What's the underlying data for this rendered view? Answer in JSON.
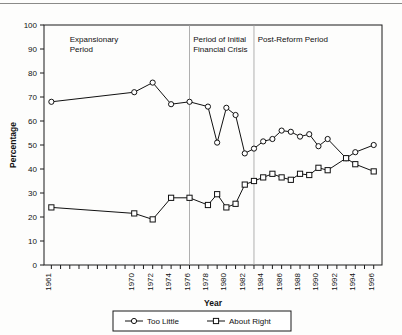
{
  "chart_data": {
    "type": "line",
    "title": "",
    "xlabel": "Year",
    "ylabel": "Percentage",
    "ylim": [
      0,
      100
    ],
    "ytick_step": 10,
    "yticks": [
      0,
      10,
      20,
      30,
      40,
      50,
      60,
      70,
      80,
      90,
      100
    ],
    "grid": false,
    "legend_position": "bottom",
    "x": [
      1961,
      1970,
      1972,
      1974,
      1976,
      1978,
      1979,
      1980,
      1981,
      1982,
      1983,
      1984,
      1985,
      1986,
      1987,
      1988,
      1989,
      1990,
      1991,
      1993,
      1994,
      1996
    ],
    "xticks": [
      1961,
      1970,
      1972,
      1974,
      1976,
      1978,
      1980,
      1982,
      1984,
      1986,
      1988,
      1990,
      1992,
      1994,
      1996
    ],
    "xtick_labels": [
      "1961",
      "1970",
      "1972",
      "1974",
      "1976",
      "1978",
      "1980",
      "1982",
      "1984",
      "1986",
      "1988",
      "1990",
      "1992",
      "1994",
      "1996"
    ],
    "series": [
      {
        "name": "Too Little",
        "marker": "circle",
        "values": [
          68,
          72,
          76,
          67,
          68,
          66,
          51,
          65.5,
          62.5,
          46.5,
          48.5,
          51.5,
          52.5,
          56,
          55.5,
          53.5,
          54.5,
          49.5,
          52.5,
          44.5,
          47,
          50
        ]
      },
      {
        "name": "About Right",
        "marker": "square",
        "values": [
          24,
          21.5,
          19,
          28,
          28,
          25,
          29.5,
          24,
          25.5,
          33.5,
          35,
          36.5,
          38,
          36.5,
          35.5,
          38,
          37.5,
          40.5,
          39.5,
          44.5,
          42,
          39
        ]
      }
    ],
    "annotations": [
      {
        "text_lines": [
          "Expansionary",
          "Period"
        ],
        "x_year": 1963,
        "y_value": 93
      },
      {
        "text_lines": [
          "Period of Initial",
          "Financial Crisis"
        ],
        "x_year": 1976.4,
        "y_value": 93
      },
      {
        "text_lines": [
          "Post-Reform Period"
        ],
        "x_year": 1983.4,
        "y_value": 93
      }
    ],
    "dividers": [
      1976,
      1983
    ]
  },
  "legend": {
    "entries": [
      {
        "label": "Too Little",
        "marker": "circle"
      },
      {
        "label": "About Right",
        "marker": "square"
      }
    ]
  },
  "colors": {
    "ink": "#111111",
    "divider": "#9a9a9a",
    "paper": "#fdfdfc",
    "marker_fill": "#ffffff"
  }
}
